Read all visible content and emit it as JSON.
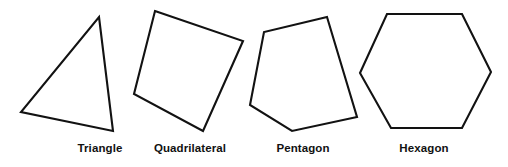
{
  "figure": {
    "background_color": "#ffffff",
    "stroke_color": "#121212",
    "label_color": "#111111",
    "width": 508,
    "height": 167
  },
  "shapes": [
    {
      "name": "triangle",
      "label": "Triangle",
      "sides": 3,
      "label_x": 100,
      "label_y": 143,
      "points": "99,17 113,131 21,112"
    },
    {
      "name": "quadrilateral",
      "label": "Quadrilateral",
      "sides": 4,
      "label_x": 190,
      "label_y": 143,
      "points": "155,11 243,41 203,131 134,94"
    },
    {
      "name": "pentagon",
      "label": "Pentagon",
      "sides": 5,
      "label_x": 303,
      "label_y": 143,
      "points": "327,17 357,117 292,131 250,105 264,32"
    },
    {
      "name": "hexagon",
      "label": "Hexagon",
      "sides": 6,
      "label_x": 424,
      "label_y": 143,
      "points": "387,14 462,14 491,72 462,128 391,128 360,73"
    }
  ]
}
